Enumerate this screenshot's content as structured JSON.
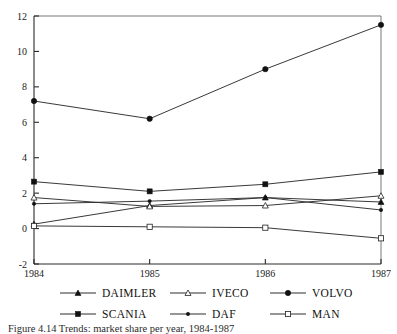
{
  "chart_data": {
    "type": "line",
    "title": "",
    "xlabel": "",
    "ylabel": "",
    "categories": [
      "1984",
      "1985",
      "1986",
      "1987"
    ],
    "x": [
      1984,
      1985,
      1986,
      1987
    ],
    "xlim": [
      1984,
      1987
    ],
    "ylim": [
      -2,
      12
    ],
    "yticks": [
      -2,
      0,
      2,
      4,
      6,
      8,
      10,
      12
    ],
    "ytick_labels": [
      "-2",
      "0",
      "2",
      "4",
      "6",
      "8",
      "10",
      "12"
    ],
    "xtick_labels": [
      "1984",
      "1985",
      "1986",
      "1987"
    ],
    "grid": false,
    "legend_position": "bottom",
    "series": [
      {
        "name": "DAIMLER",
        "marker": "filled-triangle",
        "values": [
          0.25,
          1.3,
          1.75,
          1.5
        ]
      },
      {
        "name": "IVECO",
        "marker": "open-triangle",
        "values": [
          1.75,
          1.25,
          1.3,
          1.85
        ]
      },
      {
        "name": "VOLVO",
        "marker": "filled-circle",
        "values": [
          7.2,
          6.2,
          9.0,
          11.5
        ]
      },
      {
        "name": "SCANIA",
        "marker": "filled-square",
        "values": [
          2.65,
          2.1,
          2.5,
          3.2
        ]
      },
      {
        "name": "DAF",
        "marker": "small-filled",
        "values": [
          1.4,
          1.55,
          1.75,
          1.05
        ]
      },
      {
        "name": "MAN",
        "marker": "open-square",
        "values": [
          0.15,
          0.1,
          0.05,
          -0.55
        ]
      }
    ]
  },
  "legend": {
    "row1": [
      {
        "label": "DAIMLER",
        "marker": "filled-triangle"
      },
      {
        "label": "IVECO",
        "marker": "open-triangle"
      },
      {
        "label": "VOLVO",
        "marker": "filled-circle"
      }
    ],
    "row2": [
      {
        "label": "SCANIA",
        "marker": "filled-square"
      },
      {
        "label": "DAF",
        "marker": "small-filled"
      },
      {
        "label": "MAN",
        "marker": "open-square"
      }
    ]
  },
  "caption": {
    "text": "Figure 4.14   Trends: market share per year, 1984-1987"
  },
  "colors": {
    "line": "#2e2e2e",
    "axis": "#2a2a2a",
    "frame": "#6a6a6a",
    "background": "#ffffff"
  }
}
